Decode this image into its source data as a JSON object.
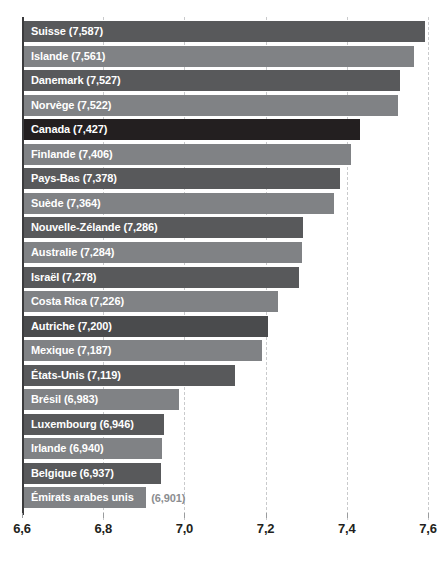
{
  "chart_data": {
    "type": "bar",
    "orientation": "horizontal",
    "title": "",
    "subtitle": "",
    "xlabel": "",
    "ylabel": "",
    "xlim": [
      6.6,
      7.6
    ],
    "grid": true,
    "grid_axis": "x",
    "grid_style": "dashed",
    "legend": false,
    "legend_position": "none",
    "value_decimal_separator": ",",
    "xticks": [
      "6,6",
      "6,8",
      "7,0",
      "7,2",
      "7,4",
      "7,6"
    ],
    "xtick_values": [
      6.6,
      6.8,
      7.0,
      7.2,
      7.4,
      7.6
    ],
    "categories": [
      "Suisse",
      "Islande",
      "Danemark",
      "Norvège",
      "Canada",
      "Finlande",
      "Pays-Bas",
      "Suède",
      "Nouvelle-Zélande",
      "Australie",
      "Israël",
      "Costa Rica",
      "Autriche",
      "Mexique",
      "États-Unis",
      "Brésil",
      "Luxembourg",
      "Irlande",
      "Belgique",
      "Émirats arabes unis"
    ],
    "values": [
      7.587,
      7.561,
      7.527,
      7.522,
      7.427,
      7.406,
      7.378,
      7.364,
      7.286,
      7.284,
      7.278,
      7.226,
      7.2,
      7.187,
      7.119,
      6.983,
      6.946,
      6.94,
      6.937,
      6.901
    ],
    "value_labels": [
      "(7,587)",
      "(7,561)",
      "(7,527)",
      "(7,522)",
      "(7,427)",
      "(7,406)",
      "(7,378)",
      "(7,364)",
      "(7,286)",
      "(7,284)",
      "(7,278)",
      "(7,226)",
      "(7,200)",
      "(7,187)",
      "(7,119)",
      "(6,983)",
      "(6,946)",
      "(6,940)",
      "(6,937)",
      "(6,901)"
    ],
    "bars": [
      {
        "label": "Suisse (7,587)",
        "name": "Suisse",
        "value_label": "(7,587)",
        "value": 7.587,
        "color": "#58595b",
        "label_inside": true,
        "highlight": false
      },
      {
        "label": "Islande (7,561)",
        "name": "Islande",
        "value_label": "(7,561)",
        "value": 7.561,
        "color": "#808285",
        "label_inside": true,
        "highlight": false
      },
      {
        "label": "Danemark (7,527)",
        "name": "Danemark",
        "value_label": "(7,527)",
        "value": 7.527,
        "color": "#58595b",
        "label_inside": true,
        "highlight": false
      },
      {
        "label": "Norvège (7,522)",
        "name": "Norvège",
        "value_label": "(7,522)",
        "value": 7.522,
        "color": "#808285",
        "label_inside": true,
        "highlight": false
      },
      {
        "label": "Canada (7,427)",
        "name": "Canada",
        "value_label": "(7,427)",
        "value": 7.427,
        "color": "#231f20",
        "label_inside": true,
        "highlight": true
      },
      {
        "label": "Finlande (7,406)",
        "name": "Finlande",
        "value_label": "(7,406)",
        "value": 7.406,
        "color": "#808285",
        "label_inside": true,
        "highlight": false
      },
      {
        "label": "Pays-Bas (7,378)",
        "name": "Pays-Bas",
        "value_label": "(7,378)",
        "value": 7.378,
        "color": "#58595b",
        "label_inside": true,
        "highlight": false
      },
      {
        "label": "Suède (7,364)",
        "name": "Suède",
        "value_label": "(7,364)",
        "value": 7.364,
        "color": "#808285",
        "label_inside": true,
        "highlight": false
      },
      {
        "label": "Nouvelle-Zélande (7,286)",
        "name": "Nouvelle-Zélande",
        "value_label": "(7,286)",
        "value": 7.286,
        "color": "#58595b",
        "label_inside": true,
        "highlight": false
      },
      {
        "label": "Australie (7,284)",
        "name": "Australie",
        "value_label": "(7,284)",
        "value": 7.284,
        "color": "#808285",
        "label_inside": true,
        "highlight": false
      },
      {
        "label": "Israël (7,278)",
        "name": "Israël",
        "value_label": "(7,278)",
        "value": 7.278,
        "color": "#58595b",
        "label_inside": true,
        "highlight": false
      },
      {
        "label": "Costa Rica (7,226)",
        "name": "Costa Rica",
        "value_label": "(7,226)",
        "value": 7.226,
        "color": "#808285",
        "label_inside": true,
        "highlight": false
      },
      {
        "label": "Autriche (7,200)",
        "name": "Autriche",
        "value_label": "(7,200)",
        "value": 7.2,
        "color": "#4a4b4d",
        "label_inside": true,
        "highlight": false
      },
      {
        "label": "Mexique (7,187)",
        "name": "Mexique",
        "value_label": "(7,187)",
        "value": 7.187,
        "color": "#808285",
        "label_inside": true,
        "highlight": false
      },
      {
        "label": "États-Unis (7,119)",
        "name": "États-Unis",
        "value_label": "(7,119)",
        "value": 7.119,
        "color": "#58595b",
        "label_inside": true,
        "highlight": false
      },
      {
        "label": "Brésil (6,983)",
        "name": "Brésil",
        "value_label": "(6,983)",
        "value": 6.983,
        "color": "#808285",
        "label_inside": true,
        "highlight": false
      },
      {
        "label": "Luxembourg (6,946)",
        "name": "Luxembourg",
        "value_label": "(6,946)",
        "value": 6.946,
        "color": "#58595b",
        "label_inside": true,
        "highlight": false
      },
      {
        "label": "Irlande (6,940)",
        "name": "Irlande",
        "value_label": "(6,940)",
        "value": 6.94,
        "color": "#808285",
        "label_inside": true,
        "highlight": false
      },
      {
        "label": "Belgique (6,937)",
        "name": "Belgique",
        "value_label": "(6,937)",
        "value": 6.937,
        "color": "#58595b",
        "label_inside": true,
        "highlight": false
      },
      {
        "label": "Émirats arabes unis",
        "name": "Émirats arabes unis",
        "value_label": "(6,901)",
        "value": 6.901,
        "color": "#808285",
        "label_inside": false,
        "highlight": false
      }
    ]
  },
  "colors": {
    "bar_dark": "#58595b",
    "bar_light": "#808285",
    "bar_highlight": "#231f20",
    "grid": "#c9cacc",
    "axis_spine": "#3b3b3d",
    "tick_text": "#231f20",
    "bar_label_text": "#ffffff",
    "outside_value_text": "#8b8d90",
    "background": "#ffffff"
  }
}
